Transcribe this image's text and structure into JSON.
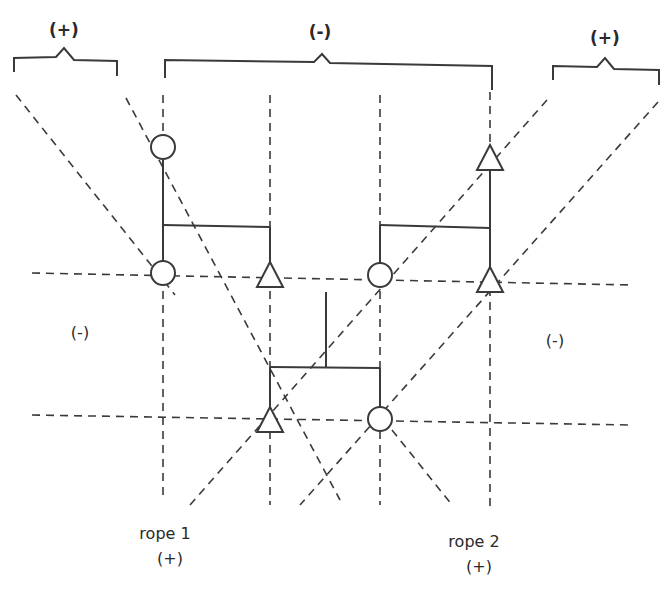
{
  "labels": {
    "top_left_sign": "(+)",
    "top_center_sign": "(-)",
    "top_right_sign": "(+)",
    "mid_left_sign": "(-)",
    "mid_right_sign": "(-)",
    "rope1_name": "rope 1",
    "rope1_sign": "(+)",
    "rope2_name": "rope 2",
    "rope2_sign": "(+)"
  },
  "colors": {
    "line": "#3a3a3a",
    "text": "#2a2a2a",
    "background": "#ffffff"
  },
  "nodes": {
    "circles": [
      {
        "x": 163,
        "y": 147
      },
      {
        "x": 163,
        "y": 273
      },
      {
        "x": 380,
        "y": 275
      },
      {
        "x": 380,
        "y": 419
      }
    ],
    "triangles": [
      {
        "x": 490,
        "y": 157
      },
      {
        "x": 270,
        "y": 275
      },
      {
        "x": 490,
        "y": 280
      },
      {
        "x": 270,
        "y": 419
      }
    ]
  }
}
